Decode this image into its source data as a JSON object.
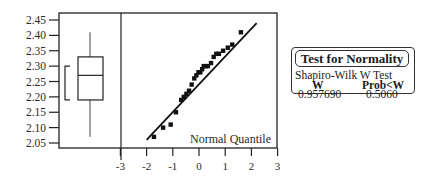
{
  "chart_data": {
    "type": "scatter",
    "xlabel": "Normal Quantile",
    "ylabel": "",
    "xlim": [
      -3,
      3
    ],
    "ylim": [
      2.05,
      2.45
    ],
    "x_ticks": [
      "-3",
      "-2",
      "-1",
      "0",
      "1",
      "2",
      "3"
    ],
    "y_ticks": [
      "2.45",
      "2.40",
      "2.35",
      "2.30",
      "2.25",
      "2.20",
      "2.15",
      "2.10",
      "2.05"
    ],
    "grid": false,
    "series": [
      {
        "name": "Observations",
        "x": [
          -1.72,
          -1.37,
          -1.08,
          -0.88,
          -0.68,
          -0.58,
          -0.48,
          -0.38,
          -0.28,
          -0.18,
          -0.1,
          -0.02,
          0.05,
          0.12,
          0.18,
          0.26,
          0.34,
          0.46,
          0.56,
          0.66,
          0.76,
          0.92,
          1.1,
          1.27,
          1.6
        ],
        "y": [
          2.07,
          2.1,
          2.11,
          2.15,
          2.19,
          2.2,
          2.21,
          2.22,
          2.24,
          2.26,
          2.27,
          2.28,
          2.28,
          2.29,
          2.3,
          2.3,
          2.3,
          2.31,
          2.33,
          2.34,
          2.34,
          2.35,
          2.36,
          2.37,
          2.41
        ]
      }
    ],
    "fit_line": {
      "x": [
        -2.0,
        2.2
      ],
      "y": [
        2.06,
        2.44
      ]
    },
    "boxplot": {
      "min": 2.07,
      "q1": 2.19,
      "median": 2.27,
      "q3": 2.33,
      "max": 2.41,
      "bracket_low": 2.19,
      "bracket_high": 2.3
    }
  },
  "normality_test": {
    "title": "Test for Normality",
    "subtitle": "Shapiro-Wilk W Test",
    "col_w": "W",
    "col_prob": "Prob<W",
    "w_value": "0.957690",
    "prob_value": "0.5060"
  }
}
